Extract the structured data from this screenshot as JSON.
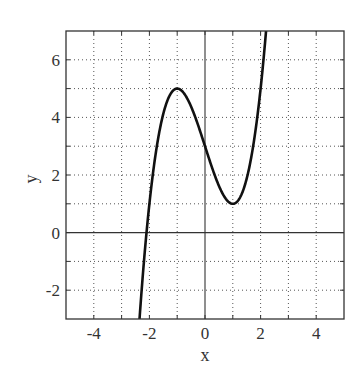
{
  "chart_data": {
    "type": "line",
    "title": "",
    "xlabel": "x",
    "ylabel": "y",
    "xlim": [
      -5,
      5
    ],
    "ylim": [
      -3,
      7
    ],
    "xticks": [
      -4,
      -2,
      0,
      2,
      4
    ],
    "yticks": [
      -2,
      0,
      2,
      4,
      6
    ],
    "x_tick_labels": [
      "-4",
      "-2",
      "0",
      "2",
      "4"
    ],
    "y_tick_labels": [
      "-2",
      "0",
      "2",
      "4",
      "6"
    ],
    "x_minor_gridlines": [
      -4,
      -3,
      -2,
      -1,
      1,
      2,
      3,
      4
    ],
    "y_minor_gridlines": [
      -2,
      -1,
      1,
      2,
      3,
      4,
      5,
      6
    ],
    "grid": true,
    "grid_style": "dotted",
    "zero_axes": true,
    "legend": null,
    "series": [
      {
        "name": "y = x^3 - 3x + 3",
        "color": "#111111",
        "key_points": [
          {
            "x": -2.35,
            "y": -3.0,
            "note": "exits bottom"
          },
          {
            "x": -2.1,
            "y": 0.0,
            "note": "x-intercept"
          },
          {
            "x": -1.0,
            "y": 5.0,
            "note": "local maximum"
          },
          {
            "x": 0.0,
            "y": 3.0,
            "note": "y-intercept"
          },
          {
            "x": 1.0,
            "y": 1.0,
            "note": "local minimum"
          },
          {
            "x": 2.2,
            "y": 7.0,
            "note": "exits top"
          }
        ],
        "x": [
          -2.35,
          -2.2,
          -2.0,
          -1.8,
          -1.6,
          -1.4,
          -1.2,
          -1.0,
          -0.8,
          -0.6,
          -0.4,
          -0.2,
          0.0,
          0.2,
          0.4,
          0.6,
          0.8,
          1.0,
          1.2,
          1.4,
          1.6,
          1.8,
          2.0,
          2.2
        ],
        "y": [
          -3.03,
          -1.05,
          1.0,
          2.57,
          3.7,
          4.46,
          4.87,
          5.0,
          4.89,
          4.58,
          4.14,
          3.59,
          3.0,
          2.41,
          1.86,
          1.42,
          1.11,
          1.0,
          1.13,
          1.54,
          2.3,
          3.43,
          5.0,
          7.05
        ]
      }
    ]
  }
}
